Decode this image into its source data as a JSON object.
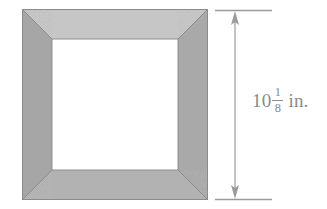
{
  "figure": {
    "kind": "geometry-diagram",
    "background_color": "#ffffff"
  },
  "frame": {
    "name": "picture-frame",
    "outer_width_px": 186,
    "outer_height_px": 191,
    "rail_width_px": 30,
    "outer_border_color": "#8a8a8a",
    "miter_line_color": "#8f8f8f",
    "opening_color": "#ffffff",
    "rails": [
      {
        "name": "top-rail",
        "color": "#c6c6c6"
      },
      {
        "name": "right-rail",
        "color": "#a8a8a8"
      },
      {
        "name": "bottom-rail",
        "color": "#b2b2b2"
      },
      {
        "name": "left-rail",
        "color": "#a5a5a5"
      }
    ]
  },
  "dimension": {
    "name": "height-dimension",
    "orientation": "vertical",
    "line_color": "#9a9a9a",
    "extension_line_color": "#9a9a9a",
    "arrowheads": [
      "up",
      "down"
    ],
    "label": {
      "whole": "10",
      "numerator": "1",
      "denominator": "8",
      "unit": "in.",
      "full_text": "10 1/8 in.",
      "color": "#8c8c8c"
    }
  }
}
